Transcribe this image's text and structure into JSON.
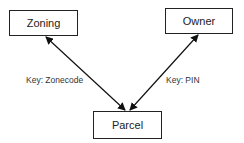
{
  "diagram": {
    "nodes": [
      {
        "id": "zoning",
        "label": "Zoning"
      },
      {
        "id": "owner",
        "label": "Owner"
      },
      {
        "id": "parcel",
        "label": "Parcel"
      }
    ],
    "edges": [
      {
        "from": "zoning",
        "to": "parcel",
        "label": "Key: Zonecode",
        "bidirectional": true
      },
      {
        "from": "owner",
        "to": "parcel",
        "label": "Key: PIN",
        "bidirectional": true
      }
    ],
    "colors": {
      "stroke": "#222222",
      "background": "#ffffff"
    }
  }
}
